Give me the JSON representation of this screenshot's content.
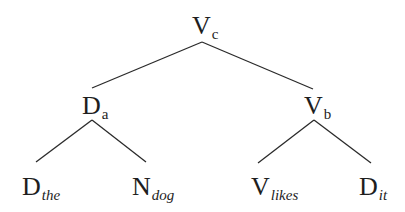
{
  "diagram": {
    "type": "syntax-tree",
    "colors": {
      "line": "#2a2a2a",
      "text": "#1e1e1e",
      "background": "#ffffff"
    },
    "nodes": {
      "root": {
        "category": "V",
        "subscript": "c",
        "subscript_italic": false
      },
      "left": {
        "category": "D",
        "subscript": "a",
        "subscript_italic": false
      },
      "right": {
        "category": "V",
        "subscript": "b",
        "subscript_italic": false
      },
      "leaf1": {
        "category": "D",
        "subscript": "the",
        "subscript_italic": true
      },
      "leaf2": {
        "category": "N",
        "subscript": "dog",
        "subscript_italic": true
      },
      "leaf3": {
        "category": "V",
        "subscript": "likes",
        "subscript_italic": true
      },
      "leaf4": {
        "category": "D",
        "subscript": "it",
        "subscript_italic": true
      }
    },
    "edges": [
      {
        "from": "root",
        "to": "left"
      },
      {
        "from": "root",
        "to": "right"
      },
      {
        "from": "left",
        "to": "leaf1"
      },
      {
        "from": "left",
        "to": "leaf2"
      },
      {
        "from": "right",
        "to": "leaf3"
      },
      {
        "from": "right",
        "to": "leaf4"
      }
    ]
  }
}
